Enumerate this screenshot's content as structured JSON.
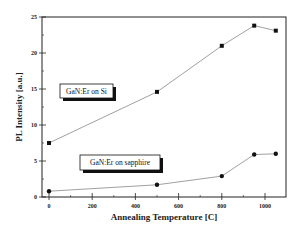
{
  "chart_data": {
    "type": "line",
    "title": "",
    "xlabel": "Annealing Temperature [C]",
    "ylabel": "PL Intensity [a.u.]",
    "xlim": [
      -30,
      1100
    ],
    "ylim": [
      0,
      25
    ],
    "x_ticks": [
      0,
      200,
      400,
      600,
      800,
      1000
    ],
    "y_ticks": [
      0,
      5,
      10,
      15,
      20,
      25
    ],
    "grid": false,
    "legend_position": "inline-annotations",
    "series": [
      {
        "name": "GaN:Er on Si",
        "x": [
          0,
          500,
          800,
          950,
          1050
        ],
        "values": [
          7.5,
          14.6,
          21.0,
          23.8,
          23.1
        ],
        "marker": "square",
        "label_box": {
          "x": 300,
          "y": 14.5
        }
      },
      {
        "name": "GaN:Er on sapphire",
        "x": [
          0,
          500,
          800,
          950,
          1050
        ],
        "values": [
          0.8,
          1.7,
          2.9,
          5.9,
          6.0
        ],
        "marker": "circle",
        "label_box": {
          "x": 490,
          "y": 4.8
        }
      }
    ]
  },
  "colors": {
    "axis": "#222222",
    "line": "#888888",
    "marker": "#111111"
  }
}
